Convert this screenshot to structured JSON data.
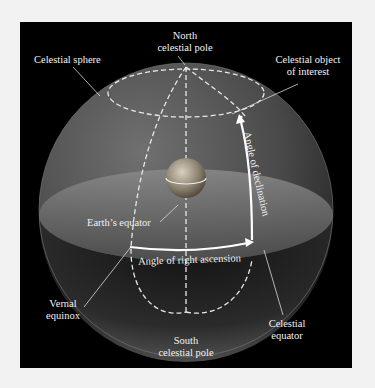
{
  "diagram": {
    "colors": {
      "background": "#f2f2f2",
      "panel": "#000000",
      "sphere": "#5a5a5a",
      "equatorial_plane": "#6e6e6e",
      "dashed_lines": "#e8e8e8",
      "arrows": "#ffffff",
      "text": "#f2f2f2"
    },
    "labels": {
      "north_pole_line1": "North",
      "north_pole_line2": "celestial pole",
      "celestial_sphere": "Celestial sphere",
      "object_line1": "Celestial object",
      "object_line2": "of interest",
      "declination": "Angle of declination",
      "earths_equator": "Earth’s equator",
      "right_ascension": "Angle of right ascension",
      "vernal_line1": "Vernal",
      "vernal_line2": "equinox",
      "celestial_equator_line1": "Celestial",
      "celestial_equator_line2": "equator",
      "south_pole_line1": "South",
      "south_pole_line2": "celestial pole"
    },
    "elements": [
      "celestial-sphere",
      "earth",
      "celestial-equator-plane",
      "north-celestial-pole",
      "south-celestial-pole",
      "vernal-equinox",
      "celestial-object",
      "declination-arc",
      "right-ascension-arc",
      "hour-circles"
    ]
  }
}
